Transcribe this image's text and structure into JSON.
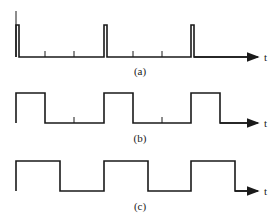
{
  "figure": {
    "panels": [
      {
        "id": "a",
        "caption": "(a)",
        "axis_label": "t",
        "description": "narrow periodic pulse train"
      },
      {
        "id": "b",
        "caption": "(b)",
        "axis_label": "t",
        "description": "rectangular wave, ~1/3 duty cycle"
      },
      {
        "id": "c",
        "caption": "(c)",
        "axis_label": "t",
        "description": "square wave, ~1/2 duty cycle"
      }
    ]
  },
  "colors": {
    "stroke": "#1a1a1a",
    "background": "#ffffff"
  }
}
